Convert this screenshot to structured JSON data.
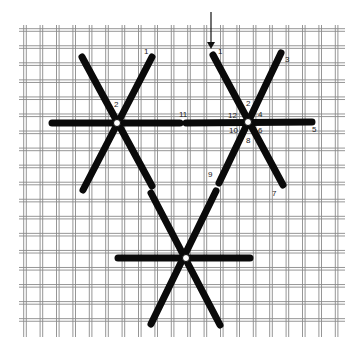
{
  "diagram": {
    "type": "needlepoint-stitch-diagram",
    "colors": {
      "background": "#ffffff",
      "grid": "#8a8a8a",
      "thread": "#0a0a0a",
      "hole": "#ffffff"
    },
    "grid": {
      "x0": 19,
      "y0": 27,
      "x1": 345,
      "y1": 337,
      "spacing": 16.4
    },
    "start_arrow": {
      "x": 211,
      "y_from": 12,
      "y_to": 48
    },
    "stars": [
      {
        "id": "left",
        "cx": 117,
        "cy": 123
      },
      {
        "id": "right",
        "cx": 248,
        "cy": 122
      },
      {
        "id": "bottom",
        "cx": 186,
        "cy": 258
      }
    ],
    "labels": [
      {
        "text": "1",
        "x": 144,
        "y": 54
      },
      {
        "text": "2",
        "x": 114,
        "y": 107
      },
      {
        "text": "11",
        "x": 179,
        "y": 117
      },
      {
        "text": "1",
        "x": 218,
        "y": 54
      },
      {
        "text": "3",
        "x": 285,
        "y": 62
      },
      {
        "text": "2",
        "x": 246,
        "y": 106
      },
      {
        "text": "12",
        "x": 228,
        "y": 118
      },
      {
        "text": "4",
        "x": 258,
        "y": 117
      },
      {
        "text": "10",
        "x": 229,
        "y": 133
      },
      {
        "text": "6",
        "x": 258,
        "y": 133
      },
      {
        "text": "8",
        "x": 246,
        "y": 143
      },
      {
        "text": "5",
        "x": 312,
        "y": 132
      },
      {
        "text": "7",
        "x": 272,
        "y": 196
      },
      {
        "text": "9",
        "x": 208,
        "y": 177
      }
    ]
  }
}
